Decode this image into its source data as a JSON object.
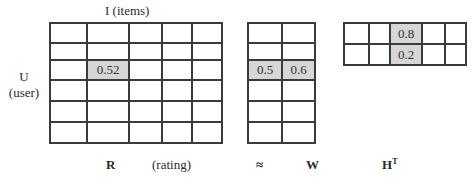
{
  "title_items": "I (items)",
  "label_user_line1": "U",
  "label_user_line2": "(user)",
  "matrix_R": {
    "name": "R",
    "caption": "(rating)",
    "rows": 6,
    "cols": 5,
    "col_widths": [
      37,
      42,
      33,
      30,
      30
    ],
    "row_heights": [
      20,
      17,
      20,
      21,
      21,
      21
    ],
    "cells": [
      [
        "",
        "",
        "",
        "",
        ""
      ],
      [
        "",
        "",
        "",
        "",
        ""
      ],
      [
        "",
        "0.52",
        "",
        "",
        ""
      ],
      [
        "",
        "",
        "",
        "",
        ""
      ],
      [
        "",
        "",
        "",
        "",
        ""
      ],
      [
        "",
        "",
        "",
        "",
        ""
      ]
    ],
    "highlight": [
      [
        2,
        1
      ]
    ]
  },
  "approx_symbol": "≈",
  "matrix_W": {
    "name": "W",
    "rows": 6,
    "cols": 2,
    "col_widths": [
      34,
      33
    ],
    "row_heights": [
      20,
      17,
      20,
      21,
      21,
      21
    ],
    "cells": [
      [
        "",
        ""
      ],
      [
        "",
        ""
      ],
      [
        "0.5",
        "0.6"
      ],
      [
        "",
        ""
      ],
      [
        "",
        ""
      ],
      [
        "",
        ""
      ]
    ],
    "highlight": [
      [
        2,
        0
      ],
      [
        2,
        1
      ]
    ]
  },
  "matrix_HT": {
    "name": "H",
    "superscript": "T",
    "rows": 2,
    "cols": 5,
    "col_widths": [
      25,
      21,
      32,
      23,
      21
    ],
    "row_heights": [
      21,
      21
    ],
    "cells": [
      [
        "",
        "",
        "0.8",
        "",
        ""
      ],
      [
        "",
        "",
        "0.2",
        "",
        ""
      ]
    ],
    "highlight": [
      [
        0,
        2
      ],
      [
        1,
        2
      ]
    ]
  },
  "colors": {
    "grid_line": "#3a3a3a",
    "highlight_fill": "#d6d6d6",
    "text": "#2a2a2a"
  }
}
